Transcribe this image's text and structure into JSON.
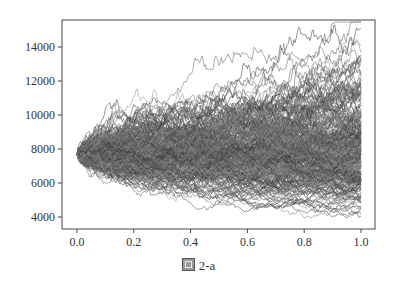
{
  "caption": {
    "icon": "figure-char-icon",
    "label": "图 2-a"
  },
  "chart_data": {
    "type": "line",
    "title": "",
    "xlabel": "",
    "ylabel": "",
    "x_range": [
      0.0,
      1.0
    ],
    "xlim": [
      -0.05,
      1.05
    ],
    "ylim": [
      3400,
      15500
    ],
    "x_ticks": [
      0.0,
      0.2,
      0.4,
      0.6,
      0.8,
      1.0
    ],
    "x_tick_labels": [
      "0.0",
      "0.2",
      "0.4",
      "0.6",
      "0.8",
      "1.0"
    ],
    "y_ticks": [
      4000,
      6000,
      8000,
      10000,
      12000,
      14000
    ],
    "y_tick_labels": [
      "4000",
      "6000",
      "8000",
      "10000",
      "12000",
      "14000"
    ],
    "grid": false,
    "legend": false,
    "simulation": {
      "start_value": 7700,
      "num_paths": 300,
      "num_steps": 250,
      "drift": 0.05,
      "volatility": 0.25,
      "envelope_at_end": {
        "min": 4100,
        "max": 14800
      }
    },
    "line_color": "#555555",
    "line_alpha": 0.55
  }
}
